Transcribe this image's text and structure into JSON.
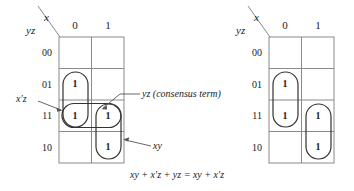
{
  "figure": {
    "colors": {
      "grid_line": "#8a8a8a",
      "oval_line": "#333333",
      "arrow_line": "#555555",
      "text": "#1a1a1a",
      "background": "#ffffff"
    },
    "equation": {
      "full": "xy + x′z + yz = xy + x′z",
      "parts": [
        "xy",
        "+",
        "x′z",
        "+",
        "yz",
        "=",
        "xy",
        "+",
        "x′z"
      ]
    },
    "maps": [
      {
        "id": "left-kmap",
        "name": "kmap-with-consensus-term",
        "header": {
          "column_variable": "x",
          "row_variable": "yz"
        },
        "column_headers": [
          "0",
          "1"
        ],
        "row_headers": [
          "00",
          "01",
          "11",
          "10"
        ],
        "cells": [
          {
            "row": "00",
            "col": "0",
            "value": ""
          },
          {
            "row": "00",
            "col": "1",
            "value": ""
          },
          {
            "row": "01",
            "col": "0",
            "value": "1"
          },
          {
            "row": "01",
            "col": "1",
            "value": ""
          },
          {
            "row": "11",
            "col": "0",
            "value": "1"
          },
          {
            "row": "11",
            "col": "1",
            "value": "1"
          },
          {
            "row": "10",
            "col": "0",
            "value": ""
          },
          {
            "row": "10",
            "col": "1",
            "value": "1"
          }
        ],
        "groups": [
          {
            "name": "group-x-prime-z",
            "label": "x′z"
          },
          {
            "name": "group-yz-consensus",
            "label": "yz (consensus term)"
          },
          {
            "name": "group-xy",
            "label": "xy"
          }
        ],
        "annotations": [
          {
            "name": "annotation-x-prime-z",
            "text": "x′z"
          },
          {
            "name": "annotation-yz-consensus",
            "text": "yz (consensus term)"
          },
          {
            "name": "annotation-xy",
            "text": "xy"
          }
        ]
      },
      {
        "id": "right-kmap",
        "name": "kmap-without-consensus-term",
        "header": {
          "column_variable": "x",
          "row_variable": "yz"
        },
        "column_headers": [
          "0",
          "1"
        ],
        "row_headers": [
          "00",
          "01",
          "11",
          "10"
        ],
        "cells": [
          {
            "row": "00",
            "col": "0",
            "value": ""
          },
          {
            "row": "00",
            "col": "1",
            "value": ""
          },
          {
            "row": "01",
            "col": "0",
            "value": "1"
          },
          {
            "row": "01",
            "col": "1",
            "value": ""
          },
          {
            "row": "11",
            "col": "0",
            "value": "1"
          },
          {
            "row": "11",
            "col": "1",
            "value": "1"
          },
          {
            "row": "10",
            "col": "0",
            "value": ""
          },
          {
            "row": "10",
            "col": "1",
            "value": "1"
          }
        ],
        "groups": [
          {
            "name": "group-x-prime-z",
            "label": "x′z"
          },
          {
            "name": "group-xy",
            "label": "xy"
          }
        ],
        "annotations": []
      }
    ]
  }
}
